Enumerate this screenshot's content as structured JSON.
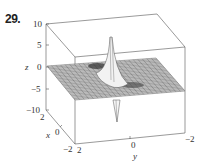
{
  "exercise_number": "29.",
  "chart_data": {
    "type": "surface3d",
    "title": "",
    "xlabel": "x",
    "ylabel": "y",
    "zlabel": "z",
    "x_range": [
      -2,
      2
    ],
    "y_range": [
      -2,
      2
    ],
    "z_range": [
      -10,
      10
    ],
    "x_ticks": [
      "2",
      "0",
      "-2"
    ],
    "y_ticks": [
      "2",
      "0",
      "-2"
    ],
    "z_ticks": [
      "10",
      "5",
      "0",
      "-5",
      "-10"
    ],
    "grid": false,
    "legend": null
  },
  "labels": {
    "z10": "10",
    "z5": "5",
    "z0": "0",
    "zm5": "−5",
    "zm10": "−10",
    "z_axis": "z",
    "x2": "2",
    "x0": "0",
    "xm2": "−2",
    "x_axis": "x",
    "y2": "2",
    "y0": "0",
    "ym2": "−2",
    "y_axis": "y"
  }
}
